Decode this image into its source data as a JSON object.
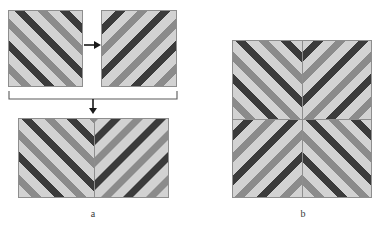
{
  "figure": {
    "title_caption_a": "a",
    "title_caption_b": "b",
    "colors": {
      "stripe_light": "#d2d2d2",
      "stripe_medium": "#8b8b8b",
      "stripe_dark": "#3b3b3b",
      "tile_border": "#8e8e8e",
      "arrow": "#1a1a1a",
      "background": "#ffffff"
    },
    "stripe_sequence": [
      "light",
      "medium",
      "light",
      "dark"
    ],
    "stripe_angle_degrees": 45,
    "source_tiles": [
      {
        "id": "tile-left",
        "direction": "backslash",
        "label": ""
      },
      {
        "id": "tile-right",
        "direction": "forwardslash",
        "label": ""
      }
    ],
    "icons": {
      "mirror_arrow": "arrow-right-icon",
      "combine_arrow": "arrow-down-icon",
      "span_bracket": "bracket-icon"
    },
    "composite_a": {
      "caption": "a",
      "rows": 1,
      "columns": 2,
      "cells": [
        {
          "row": 0,
          "col": 0,
          "direction": "backslash"
        },
        {
          "row": 0,
          "col": 1,
          "direction": "forwardslash"
        }
      ]
    },
    "composite_b": {
      "caption": "b",
      "rows": 2,
      "columns": 2,
      "cells": [
        {
          "row": 0,
          "col": 0,
          "direction": "backslash"
        },
        {
          "row": 0,
          "col": 1,
          "direction": "forwardslash"
        },
        {
          "row": 1,
          "col": 0,
          "direction": "forwardslash"
        },
        {
          "row": 1,
          "col": 1,
          "direction": "backslash"
        }
      ]
    }
  }
}
